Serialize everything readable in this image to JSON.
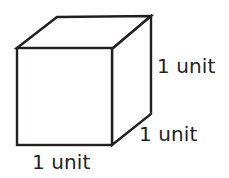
{
  "figure": {
    "kind": "geometry-diagram",
    "background_color": "#ffffff",
    "stroke_color": "#231f20",
    "stroke_width": 2.4,
    "face_fill": "#ffffff"
  },
  "labels": {
    "height": "1 unit",
    "depth": "1 unit",
    "width": "1 unit"
  },
  "geometry": {
    "front_face": {
      "top_left": [
        17,
        48
      ],
      "top_right": [
        112,
        49
      ],
      "bottom_right": [
        112,
        145
      ],
      "bottom_left": [
        17,
        145
      ]
    },
    "back_offset": [
      39,
      -32
    ],
    "top_back_left": [
      57,
      17
    ],
    "top_back_right": [
      151,
      16
    ],
    "right_back_bottom": [
      151,
      114
    ],
    "visible_edges": [
      "front-top",
      "front-right",
      "front-bottom",
      "front-left",
      "top-left-diagonal",
      "top-right-diagonal",
      "top-back",
      "right-back-vertical",
      "bottom-right-diagonal"
    ]
  }
}
